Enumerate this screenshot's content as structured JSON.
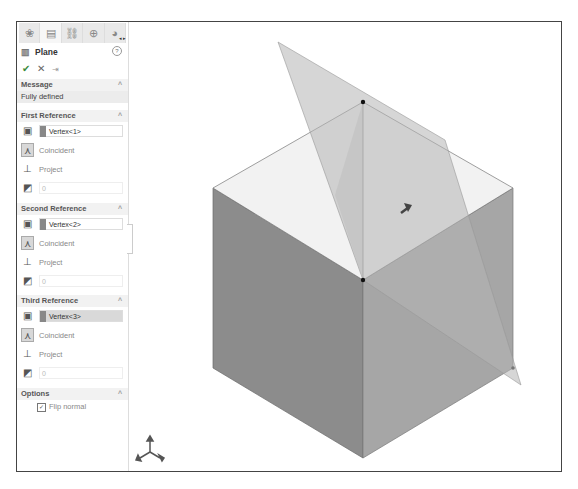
{
  "panel": {
    "tabs": [
      {
        "icon": "feature-manager-icon",
        "glyph": "❀"
      },
      {
        "icon": "property-manager-icon",
        "glyph": "▤"
      },
      {
        "icon": "configuration-manager-icon",
        "glyph": "⛓"
      },
      {
        "icon": "dimxpert-icon",
        "glyph": "⊕"
      },
      {
        "icon": "display-manager-icon",
        "glyph": "◕"
      }
    ],
    "tab_arrows": "◂ ▸",
    "title": "Plane",
    "title_icon": "▥",
    "help_label": "?",
    "actions": {
      "ok": "✔",
      "cancel": "✕",
      "pin": "⇥"
    },
    "message": {
      "header": "Message",
      "text": "Fully defined"
    },
    "references": [
      {
        "header": "First Reference",
        "entity": "Vertex<1>",
        "selected": false,
        "relation": "Coincident",
        "project": "Project",
        "value": "0"
      },
      {
        "header": "Second Reference",
        "entity": "Vertex<2>",
        "selected": false,
        "relation": "Coincident",
        "project": "Project",
        "value": "0"
      },
      {
        "header": "Third Reference",
        "entity": "Vertex<3>",
        "selected": true,
        "relation": "Coincident",
        "project": "Project",
        "value": "0"
      }
    ],
    "options": {
      "header": "Options",
      "flip_normal_label": "Flip normal",
      "flip_normal_checked": true
    },
    "caret": "^"
  },
  "viewport": {
    "colors": {
      "top_face": "#f2f2f2",
      "left_face": "#8c8c8c",
      "right_face": "#a6a6a6",
      "plane": "#c8c8c8"
    }
  }
}
